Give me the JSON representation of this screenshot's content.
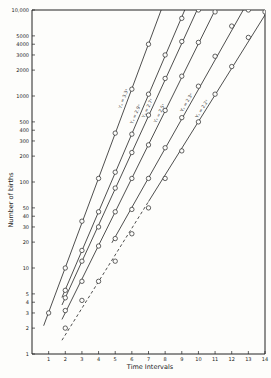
{
  "chart_data": {
    "type": "line",
    "title": "",
    "xlabel": "Time Intervals",
    "ylabel": "Number of births",
    "yscale": "log",
    "xlim": [
      0,
      14
    ],
    "ylim": [
      1,
      10000
    ],
    "grid": false,
    "x_ticks": [
      "1",
      "2",
      "3",
      "4",
      "5",
      "6",
      "7",
      "8",
      "9",
      "10",
      "11",
      "12",
      "13",
      "14"
    ],
    "y_ticks": [
      {
        "value": 1,
        "label": "1"
      },
      {
        "value": 2,
        "label": "2"
      },
      {
        "value": 3,
        "label": "3"
      },
      {
        "value": 4,
        "label": "4"
      },
      {
        "value": 5,
        "label": "5"
      },
      {
        "value": 10,
        "label": "10"
      },
      {
        "value": 20,
        "label": "20"
      },
      {
        "value": 30,
        "label": "30"
      },
      {
        "value": 40,
        "label": "40"
      },
      {
        "value": 50,
        "label": "50"
      },
      {
        "value": 100,
        "label": "100"
      },
      {
        "value": 200,
        "label": "200"
      },
      {
        "value": 300,
        "label": "300"
      },
      {
        "value": 400,
        "label": "400"
      },
      {
        "value": 500,
        "label": "500"
      },
      {
        "value": 1000,
        "label": "1000"
      },
      {
        "value": 2000,
        "label": "2000"
      },
      {
        "value": 3000,
        "label": "3000"
      },
      {
        "value": 4000,
        "label": "4000"
      },
      {
        "value": 5000,
        "label": "5000"
      },
      {
        "value": 10000,
        "label": "10,000"
      }
    ],
    "series": [
      {
        "name": "Yₓ = 3.3ˣ",
        "style": "solid",
        "x": [
          1,
          2,
          3,
          4,
          5,
          6,
          7
        ],
        "values": [
          3,
          10,
          35,
          110,
          370,
          1200,
          4000
        ],
        "line_x": [
          0.7,
          8.2
        ]
      },
      {
        "name": "Yₓ = 2.9ˣ",
        "style": "solid",
        "x": [
          2,
          3,
          4,
          5,
          6,
          7,
          8,
          9
        ],
        "values": [
          5.5,
          16,
          45,
          130,
          360,
          1050,
          3000,
          8000
        ],
        "line_x": [
          1.8,
          9.2
        ]
      },
      {
        "name": "Yₓ = 2.7ˣ",
        "style": "solid",
        "x": [
          2,
          3,
          4,
          5,
          6,
          7,
          8,
          9,
          10
        ],
        "values": [
          4.5,
          12,
          30,
          85,
          220,
          600,
          1600,
          4300,
          10000
        ],
        "line_x": [
          1.8,
          10
        ]
      },
      {
        "name": "Yₓ = 2.5ˣ",
        "style": "solid",
        "x": [
          2,
          3,
          4,
          5,
          6,
          7,
          8,
          9,
          10,
          11
        ],
        "values": [
          3.2,
          7,
          18,
          45,
          110,
          270,
          680,
          1700,
          4200,
          9500
        ],
        "line_x": [
          1.8,
          11.2
        ]
      },
      {
        "name": "Yₓ = 2.3ˣ",
        "style": "solid",
        "x": [
          5,
          6,
          7,
          8,
          9,
          10,
          11,
          12,
          13
        ],
        "values": [
          22,
          48,
          110,
          250,
          560,
          1300,
          2900,
          6500,
          10000
        ],
        "line_x": [
          4.8,
          13.4
        ]
      },
      {
        "name": "Yₓ = 2.2ˣ",
        "style": "dashed-then-solid",
        "x": [
          2,
          3,
          4,
          5,
          6,
          7,
          8,
          9,
          10,
          11,
          12,
          13,
          14
        ],
        "values": [
          2,
          4.2,
          7,
          12,
          25,
          50,
          110,
          230,
          500,
          1050,
          2200,
          4800,
          9500
        ],
        "line_x": [
          1.8,
          14
        ]
      }
    ],
    "legend": "inline rotated labels along each line"
  }
}
